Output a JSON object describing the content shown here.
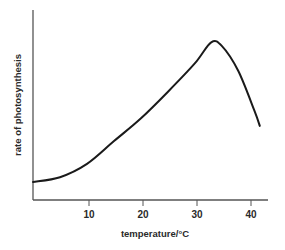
{
  "chart_data": {
    "type": "line",
    "title": "",
    "xlabel": "temperature/°C",
    "ylabel": "rate of photosynthesis",
    "xticks": [
      10,
      20,
      30,
      40
    ],
    "xtick_labels": [
      "10",
      "20",
      "30",
      "40"
    ],
    "yticks": [],
    "xlim": [
      0,
      43
    ],
    "ylim": [
      0,
      100
    ],
    "grid": false,
    "legend": null,
    "series": [
      {
        "name": "rate of photosynthesis",
        "color": "#1a1a1a",
        "x": [
          0,
          5,
          10,
          15,
          20,
          25,
          30,
          33,
          35,
          38,
          41,
          42
        ],
        "values": [
          9.5,
          12,
          19,
          31,
          43,
          57,
          72,
          83,
          81,
          68,
          47,
          39
        ]
      }
    ],
    "annotations": []
  },
  "colors": {
    "axis": "#555555",
    "curve": "#1a1a1a",
    "text": "#2a2a2a",
    "background": "#ffffff"
  }
}
